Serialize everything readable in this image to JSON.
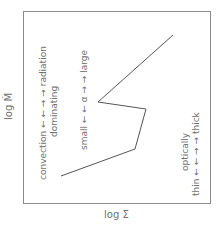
{
  "diagram": {
    "x_axis_label": "log Σ",
    "y_axis_label": "log Ṁ",
    "annotations": {
      "convection_radiation": "convection ← ← → → radiation",
      "dominating": "dominating",
      "alpha_scale": "small ← ← α → → large",
      "optically": "optically",
      "thin_thick": "thin ← ← → → thick"
    },
    "frame": {
      "x1": 23,
      "y1": 11,
      "x2": 211,
      "y2": 203
    },
    "curve_points": [
      [
        61,
        176
      ],
      [
        135,
        149
      ],
      [
        146,
        109
      ],
      [
        98,
        102
      ],
      [
        173,
        35
      ]
    ],
    "colors": {
      "line": "#555555",
      "frame": "#8a8a8a",
      "text": "#707070"
    }
  }
}
